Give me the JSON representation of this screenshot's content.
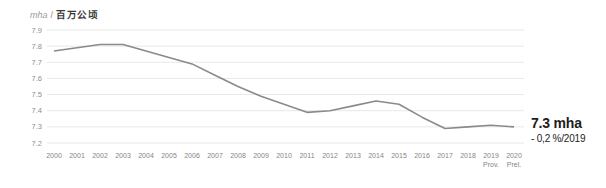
{
  "header": {
    "unit_en": "mha",
    "separator": "/",
    "unit_cn": "百万公顷"
  },
  "chart_data": {
    "type": "line",
    "xlabel": "",
    "ylabel": "mha / 百万公顷",
    "x": [
      "2000",
      "2001",
      "2002",
      "2003",
      "2004",
      "2005",
      "2006",
      "2007",
      "2008",
      "2009",
      "2010",
      "2011",
      "2012",
      "2013",
      "2014",
      "2015",
      "2016",
      "2017",
      "2018",
      "2019",
      "2020"
    ],
    "x_notes": [
      "",
      "",
      "",
      "",
      "",
      "",
      "",
      "",
      "",
      "",
      "",
      "",
      "",
      "",
      "",
      "",
      "",
      "",
      "",
      "Prov.",
      "Prel."
    ],
    "values": [
      7.77,
      7.79,
      7.81,
      7.81,
      7.77,
      7.73,
      7.69,
      7.62,
      7.55,
      7.49,
      7.44,
      7.39,
      7.4,
      7.43,
      7.46,
      7.44,
      7.36,
      7.29,
      7.3,
      7.31,
      7.3
    ],
    "ylim": [
      7.2,
      7.9
    ],
    "yticks": [
      "7.9",
      "7.8",
      "7.7",
      "7.6",
      "7.5",
      "7.4",
      "7.3",
      "7.2"
    ],
    "grid": "horizontal",
    "legend": "none",
    "annotation": {
      "value": "7.3 mha",
      "change": "- 0,2 %/2019"
    }
  },
  "colors": {
    "line": "#8a8a8a",
    "grid": "#e8e8e8",
    "tick_text": "#8f8f8f",
    "annotation_text": "#1d1d1b"
  }
}
